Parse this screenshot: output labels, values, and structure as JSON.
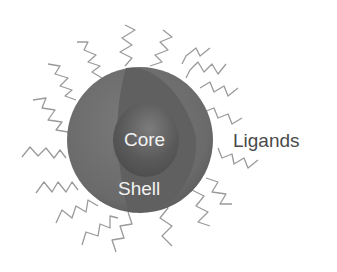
{
  "diagram": {
    "labels": {
      "core": "Core",
      "shell": "Shell",
      "ligands": "Ligands"
    },
    "colors": {
      "background": "#ffffff",
      "shell": "#6e6e6e",
      "shell_cut_face": "#5f5f5f",
      "core": "#555555",
      "core_highlight": "#7a7a7a",
      "ligand_stroke": "#9a9a9a",
      "label_on_sphere": "#f2f2f2",
      "label_outside": "#4a4a4a"
    },
    "ligand_count": 18
  }
}
